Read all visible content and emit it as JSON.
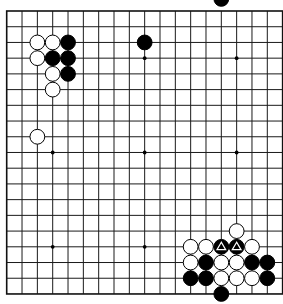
{
  "board": {
    "size": 19,
    "origin_x": 6.7,
    "origin_y": 11,
    "spacing_x": 15.33,
    "spacing_y": 15.72,
    "stone_radius": 7.4,
    "colors": {
      "background": "#ffffff",
      "line": "#1a1a1a",
      "black_stone": "#000000",
      "white_stone": "#ffffff",
      "marker": "#ffffff"
    },
    "star_points": [
      [
        3,
        3
      ],
      [
        9,
        3
      ],
      [
        15,
        3
      ],
      [
        3,
        9
      ],
      [
        9,
        9
      ],
      [
        15,
        9
      ],
      [
        3,
        15
      ],
      [
        9,
        15
      ],
      [
        15,
        15
      ]
    ],
    "stones": [
      {
        "color": "white",
        "col": 2,
        "row": 2
      },
      {
        "color": "white",
        "col": 3,
        "row": 2
      },
      {
        "color": "black",
        "col": 4,
        "row": 2
      },
      {
        "color": "white",
        "col": 2,
        "row": 3
      },
      {
        "color": "black",
        "col": 3,
        "row": 3
      },
      {
        "color": "black",
        "col": 4,
        "row": 3
      },
      {
        "color": "white",
        "col": 3,
        "row": 4
      },
      {
        "color": "black",
        "col": 4,
        "row": 4
      },
      {
        "color": "white",
        "col": 3,
        "row": 5
      },
      {
        "color": "black",
        "col": 9,
        "row": 2
      },
      {
        "color": "white",
        "col": 2,
        "row": 8
      },
      {
        "color": "white",
        "col": 15,
        "row": 14
      },
      {
        "color": "white",
        "col": 12,
        "row": 15
      },
      {
        "color": "white",
        "col": 13,
        "row": 15
      },
      {
        "color": "black",
        "col": 14,
        "row": 15,
        "marker": "triangle"
      },
      {
        "color": "black",
        "col": 15,
        "row": 15,
        "marker": "triangle"
      },
      {
        "color": "white",
        "col": 16,
        "row": 15
      },
      {
        "color": "white",
        "col": 12,
        "row": 16
      },
      {
        "color": "black",
        "col": 13,
        "row": 16
      },
      {
        "color": "white",
        "col": 14,
        "row": 16
      },
      {
        "color": "white",
        "col": 15,
        "row": 16
      },
      {
        "color": "black",
        "col": 16,
        "row": 16
      },
      {
        "color": "black",
        "col": 17,
        "row": 16
      },
      {
        "color": "black",
        "col": 12,
        "row": 17
      },
      {
        "color": "black",
        "col": 13,
        "row": 17
      },
      {
        "color": "white",
        "col": 14,
        "row": 17
      },
      {
        "color": "white",
        "col": 15,
        "row": 17
      },
      {
        "color": "white",
        "col": 16,
        "row": 17
      },
      {
        "color": "black",
        "col": 17,
        "row": 17
      },
      {
        "color": "black",
        "col": 14,
        "row": 18
      }
    ],
    "off_board_stones": [
      {
        "color": "black",
        "col": 14,
        "row": -0.77,
        "note": "partially visible above board"
      }
    ]
  }
}
